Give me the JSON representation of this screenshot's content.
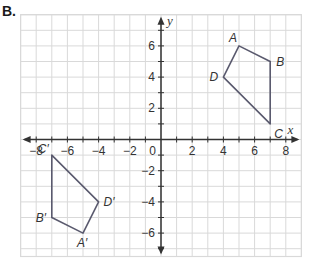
{
  "part_label": "B.",
  "chart_data": {
    "type": "scatter",
    "title": "",
    "xlabel": "x",
    "ylabel": "y",
    "xlim": [
      -9,
      9
    ],
    "ylim": [
      -7.5,
      8
    ],
    "grid": true,
    "x_tick_labels": [
      "-8",
      "-6",
      "-4",
      "-2",
      "2",
      "4",
      "6",
      "8"
    ],
    "y_tick_labels": [
      "6",
      "4",
      "2",
      "-2",
      "-4",
      "-6"
    ],
    "origin_label": "0",
    "polygons": [
      {
        "name": "ABCD",
        "vertices": [
          {
            "label": "A",
            "x": 5,
            "y": 6
          },
          {
            "label": "B",
            "x": 7,
            "y": 5
          },
          {
            "label": "C",
            "x": 7,
            "y": 1
          },
          {
            "label": "D",
            "x": 4,
            "y": 4
          }
        ]
      },
      {
        "name": "A'B'C'D'",
        "vertices": [
          {
            "label": "A′",
            "x": -5,
            "y": -6
          },
          {
            "label": "B′",
            "x": -7,
            "y": -5
          },
          {
            "label": "C′",
            "x": -7,
            "y": -1
          },
          {
            "label": "D′",
            "x": -4,
            "y": -4
          }
        ]
      }
    ]
  },
  "colors": {
    "grid": "#d9d9d9",
    "axis": "#333333",
    "polygon": "#5a5a6e"
  }
}
